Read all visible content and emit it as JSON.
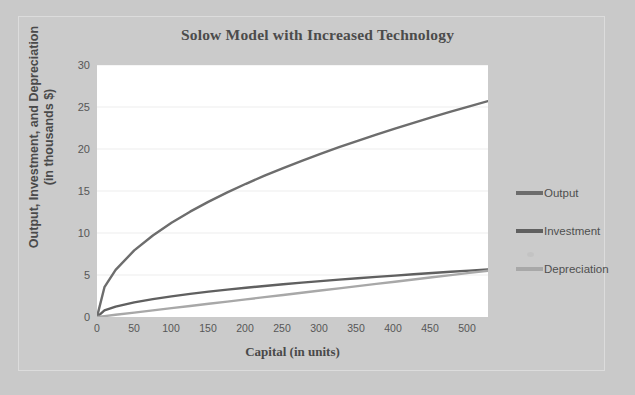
{
  "figure": {
    "title": "Solow Model with Increased Technology",
    "background_color": "#c9c9c9",
    "plot_background_color": "#ffffff",
    "frame_color": "#dcdcdc"
  },
  "legend": {
    "position": "right",
    "items": [
      {
        "label": "Output",
        "color": "#6d6d6d"
      },
      {
        "label": "Investment",
        "color": "#606060"
      },
      {
        "label": "Depreciation",
        "color": "#a8a8a8"
      }
    ]
  },
  "axes": {
    "x": {
      "title": "Capital (in units)",
      "ticks": [
        "0",
        "50",
        "100",
        "150",
        "200",
        "250",
        "300",
        "350",
        "400",
        "450",
        "500"
      ]
    },
    "y": {
      "title_line1": "Output, Investment, and Depreciation",
      "title_line2": "(in thousands $)",
      "ticks": [
        "30",
        "25",
        "20",
        "15",
        "10",
        "5",
        "0"
      ]
    }
  },
  "chart_data": {
    "type": "line",
    "title": "Solow Model with Increased Technology",
    "xlabel": "Capital (in units)",
    "ylabel": "Output, Investment, and Depreciation (in thousands $)",
    "xlim": [
      0,
      525
    ],
    "ylim": [
      0,
      30
    ],
    "xticks": [
      0,
      50,
      100,
      150,
      200,
      250,
      300,
      350,
      400,
      450,
      500
    ],
    "yticks": [
      0,
      5,
      10,
      15,
      20,
      25,
      30
    ],
    "grid": "horizontal",
    "legend_position": "right",
    "x": [
      0,
      10,
      25,
      50,
      75,
      100,
      125,
      150,
      175,
      200,
      225,
      250,
      275,
      300,
      325,
      350,
      375,
      400,
      425,
      450,
      475,
      500,
      525
    ],
    "series": [
      {
        "name": "Output",
        "color": "#6d6d6d",
        "values": [
          0,
          3.55,
          5.61,
          7.93,
          9.71,
          11.21,
          12.54,
          13.73,
          14.83,
          15.86,
          16.82,
          17.73,
          18.6,
          19.43,
          20.22,
          20.98,
          21.72,
          22.43,
          23.12,
          23.79,
          24.45,
          25.08,
          25.7
        ]
      },
      {
        "name": "Investment",
        "color": "#606060",
        "values": [
          0,
          0.78,
          1.23,
          1.74,
          2.13,
          2.46,
          2.75,
          3.02,
          3.26,
          3.48,
          3.69,
          3.9,
          4.09,
          4.27,
          4.45,
          4.61,
          4.78,
          4.93,
          5.09,
          5.23,
          5.38,
          5.52,
          5.65
        ]
      },
      {
        "name": "Depreciation",
        "color": "#a8a8a8",
        "values": [
          0,
          0.105,
          0.262,
          0.525,
          0.787,
          1.05,
          1.312,
          1.575,
          1.837,
          2.1,
          2.362,
          2.625,
          2.887,
          3.15,
          3.412,
          3.675,
          3.937,
          4.2,
          4.462,
          4.725,
          4.987,
          5.25,
          5.512
        ]
      }
    ]
  }
}
